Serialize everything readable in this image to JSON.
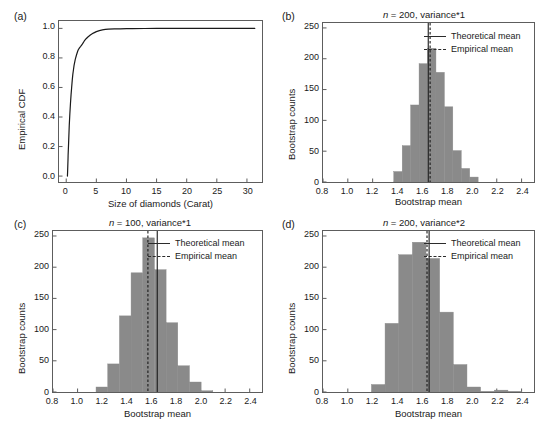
{
  "figure": {
    "panels": [
      {
        "tag": "(a)",
        "title": "",
        "xlabel": "Size of diamonds (Carat)",
        "ylabel": "Empirical CDF"
      },
      {
        "tag": "(b)",
        "title_n": "n",
        "title_rest": " = 200, variance*1",
        "xlabel": "Bootstrap mean",
        "ylabel": "Bootstrap counts"
      },
      {
        "tag": "(c)",
        "title_n": "n",
        "title_rest": " = 100, variance*1",
        "xlabel": "Bootstrap mean",
        "ylabel": "Bootstrap counts"
      },
      {
        "tag": "(d)",
        "title_n": "n",
        "title_rest": " = 200, variance*2",
        "xlabel": "Bootstrap mean",
        "ylabel": "Bootstrap counts"
      }
    ],
    "legend": {
      "theoretical": "Theoretical mean",
      "empirical": "Empirical mean"
    },
    "colors": {
      "bar_fill": "#8a8a8a",
      "axis": "#5d5d5d",
      "line": "#1a1a1a",
      "background": "#ffffff"
    }
  },
  "chart_data": [
    {
      "id": "panel-a",
      "type": "line",
      "title": "",
      "xlabel": "Size of diamonds (Carat)",
      "ylabel": "Empirical CDF",
      "xlim": [
        -1.2,
        32.5
      ],
      "ylim": [
        -0.04,
        1.05
      ],
      "xticks": [
        0,
        5,
        10,
        15,
        20,
        25,
        30
      ],
      "xticklabels": [
        "0",
        "5",
        "10",
        "15",
        "20",
        "25",
        "30"
      ],
      "yticks": [
        0.0,
        0.2,
        0.4,
        0.6,
        0.8,
        1.0
      ],
      "yticklabels": [
        "0.0",
        "0.2",
        "0.4",
        "0.6",
        "0.8",
        "1.0"
      ],
      "grid": false,
      "legend": "none",
      "series": [
        {
          "name": "Empirical CDF of diamond carat",
          "x": [
            0.2,
            0.23,
            0.3,
            0.31,
            0.4,
            0.5,
            0.6,
            0.7,
            0.8,
            0.9,
            1.0,
            1.1,
            1.2,
            1.3,
            1.5,
            1.7,
            1.9,
            2.0,
            2.2,
            2.4,
            2.5,
            2.7,
            3.0,
            3.3,
            3.6,
            4.0,
            4.5,
            5.0,
            5.5,
            6.0,
            6.5,
            7.0,
            8.0,
            9.0,
            10.0,
            11.0,
            13.0,
            15.0,
            18.0,
            21.0,
            25.0,
            28.0,
            31.3
          ],
          "y": [
            0.0,
            0.03,
            0.12,
            0.14,
            0.23,
            0.34,
            0.42,
            0.49,
            0.55,
            0.6,
            0.65,
            0.69,
            0.72,
            0.75,
            0.79,
            0.82,
            0.845,
            0.855,
            0.868,
            0.878,
            0.884,
            0.895,
            0.915,
            0.93,
            0.942,
            0.955,
            0.968,
            0.978,
            0.985,
            0.99,
            0.993,
            0.9955,
            0.9965,
            0.997,
            0.9985,
            0.999,
            0.9993,
            0.9995,
            0.9996,
            0.9997,
            0.9998,
            0.9999,
            1.0
          ]
        }
      ]
    },
    {
      "id": "panel-b",
      "type": "bar",
      "title": "n = 200, variance*1",
      "xlabel": "Bootstrap mean",
      "ylabel": "Bootstrap counts",
      "xlim": [
        0.8,
        2.5
      ],
      "ylim": [
        0,
        258
      ],
      "xticks": [
        0.8,
        1.0,
        1.2,
        1.4,
        1.6,
        1.8,
        2.0,
        2.2,
        2.4
      ],
      "xticklabels": [
        "0.8",
        "1.0",
        "1.2",
        "1.4",
        "1.6",
        "1.8",
        "2.0",
        "2.2",
        "2.4"
      ],
      "yticks": [
        0,
        50,
        100,
        150,
        200,
        250
      ],
      "yticklabels": [
        "0",
        "50",
        "100",
        "150",
        "200",
        "250"
      ],
      "grid": false,
      "legend": "upper right",
      "bin_edges": [
        1.37,
        1.438,
        1.506,
        1.574,
        1.642,
        1.71,
        1.778,
        1.846,
        1.914,
        1.982,
        2.05
      ],
      "categories": [
        "1.37-1.44",
        "1.44-1.51",
        "1.51-1.57",
        "1.57-1.64",
        "1.64-1.71",
        "1.71-1.78",
        "1.78-1.85",
        "1.85-1.91",
        "1.91-1.98",
        "1.98-2.05"
      ],
      "values": [
        17,
        59,
        125,
        192,
        217,
        178,
        122,
        51,
        22,
        8
      ],
      "vlines": [
        {
          "name": "Theoretical mean",
          "x": 1.648,
          "style": "solid"
        },
        {
          "name": "Empirical mean",
          "x": 1.663,
          "style": "dashed"
        }
      ]
    },
    {
      "id": "panel-c",
      "type": "bar",
      "title": "n = 100, variance*1",
      "xlabel": "Bootstrap mean",
      "ylabel": "Bootstrap counts",
      "xlim": [
        0.8,
        2.5
      ],
      "ylim": [
        0,
        258
      ],
      "xticks": [
        0.8,
        1.0,
        1.2,
        1.4,
        1.6,
        1.8,
        2.0,
        2.2,
        2.4
      ],
      "xticklabels": [
        "0.8",
        "1.0",
        "1.2",
        "1.4",
        "1.6",
        "1.8",
        "2.0",
        "2.2",
        "2.4"
      ],
      "yticks": [
        0,
        50,
        100,
        150,
        200,
        250
      ],
      "yticklabels": [
        "0",
        "50",
        "100",
        "150",
        "200",
        "250"
      ],
      "grid": false,
      "legend": "upper right",
      "bin_edges": [
        1.15,
        1.245,
        1.34,
        1.435,
        1.53,
        1.625,
        1.72,
        1.815,
        1.91,
        2.005,
        2.1
      ],
      "categories": [
        "1.15-1.25",
        "1.25-1.34",
        "1.34-1.44",
        "1.44-1.53",
        "1.53-1.63",
        "1.63-1.72",
        "1.72-1.82",
        "1.82-1.91",
        "1.91-2.01",
        "2.01-2.10"
      ],
      "values": [
        8,
        45,
        122,
        191,
        247,
        196,
        111,
        42,
        16,
        2
      ],
      "vlines": [
        {
          "name": "Empirical mean",
          "x": 1.572,
          "style": "dashed"
        },
        {
          "name": "Theoretical mean",
          "x": 1.648,
          "style": "solid"
        }
      ]
    },
    {
      "id": "panel-d",
      "type": "bar",
      "title": "n = 200, variance*2",
      "xlabel": "Bootstrap mean",
      "ylabel": "Bootstrap counts",
      "xlim": [
        0.8,
        2.5
      ],
      "ylim": [
        0,
        258
      ],
      "xticks": [
        0.8,
        1.0,
        1.2,
        1.4,
        1.6,
        1.8,
        2.0,
        2.2,
        2.4
      ],
      "xticklabels": [
        "0.8",
        "1.0",
        "1.2",
        "1.4",
        "1.6",
        "1.8",
        "2.0",
        "2.2",
        "2.4"
      ],
      "yticks": [
        0,
        50,
        100,
        150,
        200,
        250
      ],
      "yticklabels": [
        "0",
        "50",
        "100",
        "150",
        "200",
        "250"
      ],
      "grid": false,
      "legend": "upper right",
      "bin_edges": [
        1.19,
        1.3,
        1.41,
        1.52,
        1.63,
        1.74,
        1.85,
        1.96,
        2.07,
        2.18,
        2.29,
        2.4
      ],
      "categories": [
        "1.19-1.30",
        "1.30-1.41",
        "1.41-1.52",
        "1.52-1.63",
        "1.63-1.74",
        "1.74-1.85",
        "1.85-1.96",
        "1.96-2.07",
        "2.07-2.18",
        "2.18-2.29",
        "2.29-2.40"
      ],
      "values": [
        12,
        110,
        220,
        240,
        214,
        128,
        44,
        8,
        1,
        3,
        1
      ],
      "vlines": [
        {
          "name": "Empirical mean",
          "x": 1.638,
          "style": "dashed"
        },
        {
          "name": "Theoretical mean",
          "x": 1.655,
          "style": "solid"
        }
      ]
    }
  ]
}
